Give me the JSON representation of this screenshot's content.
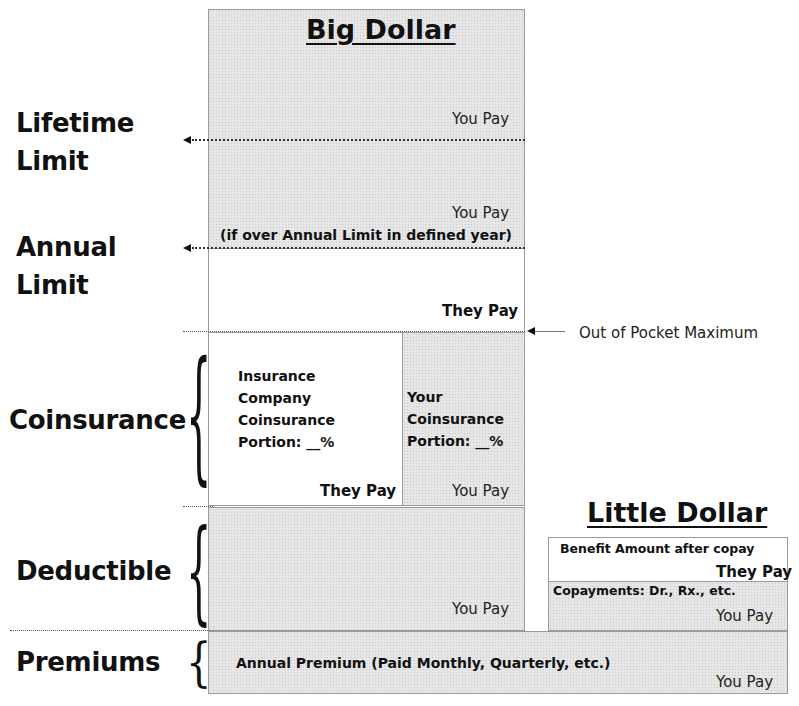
{
  "big_dollar": {
    "title": "Big Dollar",
    "lifetime_you_pay": "You Pay",
    "annual_you_pay": "You Pay",
    "annual_note": "(if over Annual Limit in defined year)",
    "annual_they_pay": "They Pay",
    "coinsurance_company": [
      "Insurance",
      "Company",
      "Coinsurance",
      "Portion: __%"
    ],
    "coinsurance_company_pay": "They Pay",
    "coinsurance_yours": [
      "Your",
      "Coinsurance",
      "Portion: __%"
    ],
    "coinsurance_yours_pay": "You Pay",
    "deductible_you_pay": "You Pay"
  },
  "left_labels": {
    "lifetime": [
      "Lifetime",
      "Limit"
    ],
    "annual": [
      "Annual",
      "Limit"
    ],
    "coinsurance": "Coinsurance",
    "deductible": "Deductible",
    "premiums": "Premiums"
  },
  "out_of_pocket": {
    "label": "Out of Pocket Maximum"
  },
  "little_dollar": {
    "title": "Little Dollar",
    "benefit_label": "Benefit Amount after copay",
    "benefit_pay": "They Pay",
    "copay_label": "Copayments: Dr., Rx., etc.",
    "copay_pay": "You Pay"
  },
  "premiums": {
    "label": "Annual Premium (Paid Monthly, Quarterly, etc.)",
    "pay": "You Pay"
  },
  "colors": {
    "shade": "#e6e6e6",
    "border": "#9a9a9a",
    "text": "#111111"
  }
}
